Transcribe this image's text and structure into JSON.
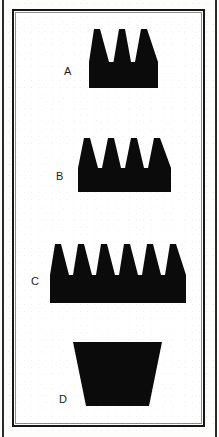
{
  "figure": {
    "background_color": "#fdfdfc",
    "ink_color": "#0b0b0b",
    "frame_color": "#151515",
    "width": 219,
    "height": 437
  },
  "shapes": [
    {
      "label": "A",
      "name": "crown-3-peaks",
      "peaks": 3,
      "description": "black crown silhouette with three triangular peaks on a rectangular base",
      "box": {
        "x": 87,
        "y": 25,
        "width": 69,
        "height": 61
      },
      "label_pos": {
        "x": 62,
        "y": 64
      },
      "base_height": 26
    },
    {
      "label": "B",
      "name": "crown-4-peaks",
      "peaks": 4,
      "description": "black crown silhouette with four triangular peaks on a rectangular base",
      "box": {
        "x": 76,
        "y": 134,
        "width": 93,
        "height": 56
      },
      "label_pos": {
        "x": 54,
        "y": 169
      },
      "base_height": 24
    },
    {
      "label": "C",
      "name": "crown-6-peaks",
      "peaks": 6,
      "description": "black crown silhouette with six triangular peaks on a rectangular base",
      "box": {
        "x": 48,
        "y": 240,
        "width": 136,
        "height": 61
      },
      "label_pos": {
        "x": 29,
        "y": 274
      },
      "base_height": 28
    },
    {
      "label": "D",
      "name": "inverted-trapezoid",
      "peaks": 0,
      "description": "solid black trapezoid, wider at the top than at the bottom",
      "box": {
        "x": 71,
        "y": 340,
        "width": 89,
        "height": 64
      },
      "label_pos": {
        "x": 57,
        "y": 392
      },
      "top_width": 89,
      "bottom_width": 63
    }
  ]
}
